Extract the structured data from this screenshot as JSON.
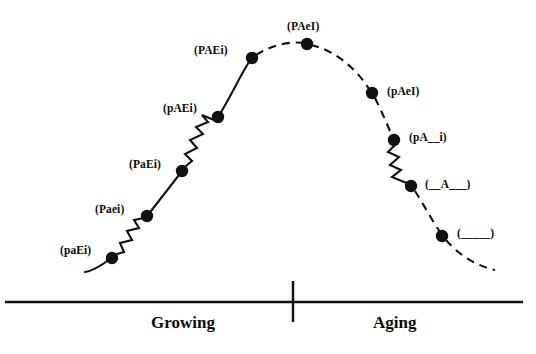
{
  "figure": {
    "background_color": "#ffffff",
    "ink_color": "#111111"
  },
  "axis": {
    "baseline_label": "horizontal-baseline",
    "divider_label": "phase-divider-tick"
  },
  "phases": [
    {
      "id": "growing",
      "label": "Growing"
    },
    {
      "id": "aging",
      "label": "Aging"
    }
  ],
  "nodes": [
    {
      "id": "n1",
      "label": "(paEi)",
      "x": 112,
      "y": 258,
      "label_x": 60,
      "label_y": 245,
      "side": "growing"
    },
    {
      "id": "n2",
      "label": "(Paei)",
      "x": 147,
      "y": 216,
      "label_x": 95,
      "label_y": 204,
      "side": "growing"
    },
    {
      "id": "n3",
      "label": "(PaEi)",
      "x": 182,
      "y": 171,
      "label_x": 129,
      "label_y": 159,
      "side": "growing"
    },
    {
      "id": "n4",
      "label": "(pAEi)",
      "x": 218,
      "y": 117,
      "label_x": 163,
      "label_y": 103,
      "side": "growing"
    },
    {
      "id": "n5",
      "label": "(PAEi)",
      "x": 252,
      "y": 58,
      "label_x": 194,
      "label_y": 45,
      "side": "growing"
    },
    {
      "id": "n6",
      "label": "(PAeI)",
      "x": 307,
      "y": 44,
      "label_x": 287,
      "label_y": 21,
      "side": "peak"
    },
    {
      "id": "n7",
      "label": "(pAeI)",
      "x": 372,
      "y": 93,
      "label_x": 387,
      "label_y": 86,
      "side": "aging"
    },
    {
      "id": "n8",
      "label": "(pA__i)",
      "x": 394,
      "y": 140,
      "label_x": 409,
      "label_y": 132,
      "side": "aging"
    },
    {
      "id": "n9",
      "label": "(__A___)",
      "x": 411,
      "y": 186,
      "label_x": 425,
      "label_y": 179,
      "side": "aging"
    },
    {
      "id": "n10",
      "label": "(_____)",
      "x": 442,
      "y": 236,
      "label_x": 457,
      "label_y": 228,
      "side": "aging"
    }
  ],
  "curve": {
    "solid_segment_desc": "growing-half-solid",
    "dashed_segment_desc": "aging-half-dashed",
    "zigzag_segments": [
      {
        "id": "z1",
        "from": "n1",
        "to": "n2"
      },
      {
        "id": "z2",
        "from": "n3",
        "to": "n4"
      },
      {
        "id": "z3",
        "from": "n8",
        "to": "n9"
      }
    ]
  }
}
